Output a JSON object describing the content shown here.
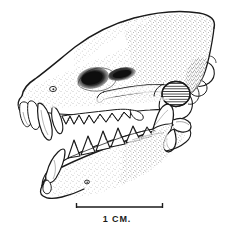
{
  "figure": {
    "kind": "scientific-line-drawing",
    "view": "lateral (left side)",
    "technique": "pen-and-ink stipple",
    "background_color": "#ffffff",
    "ink_color": "#1a1a1a",
    "stipple_color": "#3a3a3a",
    "shadow_color": "#111111"
  },
  "scale_bar": {
    "label": "1 CM.",
    "x_start_px": 76,
    "x_end_px": 163,
    "y_px": 207,
    "tick_height_px": 6,
    "bar_thickness_px": 1.4,
    "length_px": 87,
    "represents": "1 cm"
  },
  "anatomy": {
    "parts": [
      {
        "name": "cranium",
        "label": "Cranium / braincase"
      },
      {
        "name": "rostrum",
        "label": "Rostrum"
      },
      {
        "name": "nasal-region",
        "label": "Nasal region"
      },
      {
        "name": "orbit",
        "label": "Orbit"
      },
      {
        "name": "infraorbital-foramen",
        "label": "Infraorbital foramen"
      },
      {
        "name": "zygomatic-arch",
        "label": "Zygomatic arch"
      },
      {
        "name": "auditory-bulla",
        "label": "Auditory bulla"
      },
      {
        "name": "occipital-region",
        "label": "Occipital region"
      },
      {
        "name": "premaxilla",
        "label": "Premaxilla"
      },
      {
        "name": "upper-incisors",
        "label": "Upper incisors"
      },
      {
        "name": "upper-canine",
        "label": "Upper canine"
      },
      {
        "name": "upper-tooth-row",
        "label": "Upper premolars and molars"
      },
      {
        "name": "mandible",
        "label": "Mandible / dentary"
      },
      {
        "name": "lower-canine",
        "label": "Lower canine"
      },
      {
        "name": "lower-tooth-row",
        "label": "Lower premolars and molars"
      },
      {
        "name": "coronoid-process",
        "label": "Coronoid process"
      },
      {
        "name": "mandibular-condyle",
        "label": "Mandibular condyle"
      },
      {
        "name": "angular-process",
        "label": "Angular process"
      },
      {
        "name": "mental-foramen",
        "label": "Mental foramen"
      }
    ],
    "tooth_counts": {
      "upper_incisors": 3,
      "upper_canine": 1,
      "upper_cheek_teeth": 7,
      "lower_canine": 1,
      "lower_cheek_teeth": 6
    }
  }
}
